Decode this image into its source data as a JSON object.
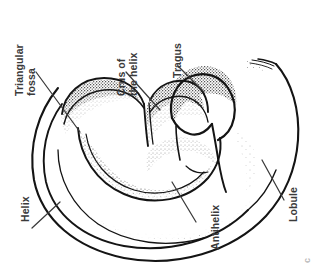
{
  "figure": {
    "orientation": "rotated 90 degrees counter-clockwise",
    "figure_mark": "c",
    "style": {
      "line_color": "#1a1a1a",
      "stipple_color": "#2b2b2b",
      "label_color": "#3a3a3a",
      "leader_color": "#3a3a3a",
      "background": "#ffffff"
    }
  },
  "labels": [
    {
      "id": "triangular-fossa",
      "text": "Triangular\nfossa",
      "rotated": true
    },
    {
      "id": "crus-of-the-helix",
      "text": "Crus of\nthe helix",
      "rotated": true
    },
    {
      "id": "tragus",
      "text": "Tragus",
      "rotated": true
    },
    {
      "id": "helix",
      "text": "Helix",
      "rotated": true
    },
    {
      "id": "antihelix",
      "text": "Antihelix",
      "rotated": true
    },
    {
      "id": "lobule",
      "text": "Lobule",
      "rotated": true
    }
  ],
  "text": {
    "triangular_fossa_line1": "Triangular",
    "triangular_fossa_line2": "fossa",
    "crus_line1": "Crus of",
    "crus_line2": "the helix",
    "tragus": "Tragus",
    "helix": "Helix",
    "antihelix": "Antihelix",
    "lobule": "Lobule",
    "figure_mark": "c"
  }
}
